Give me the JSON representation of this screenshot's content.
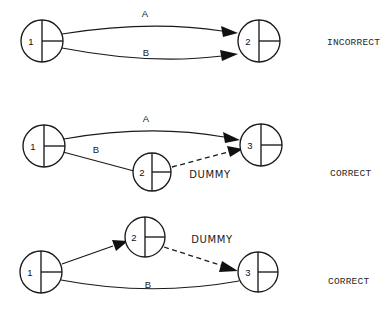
{
  "page": {
    "background_color": "#ffffff",
    "line_color": "#1a1a1a",
    "text_color": "#1a1a1a"
  },
  "diagrams": [
    {
      "id": "diagram-incorrect",
      "verdict": "INCORRECT",
      "nodes": [
        {
          "id": "n1",
          "label": "1"
        },
        {
          "id": "n2",
          "label": "2"
        }
      ],
      "edges": [
        {
          "id": "e-a",
          "label": "A",
          "style": "solid",
          "from": "1",
          "to": "2"
        },
        {
          "id": "e-b",
          "label": "B",
          "style": "solid",
          "from": "1",
          "to": "2"
        }
      ]
    },
    {
      "id": "diagram-correct-1",
      "verdict": "CORRECT",
      "nodes": [
        {
          "id": "n1",
          "label": "1"
        },
        {
          "id": "n2",
          "label": "2"
        },
        {
          "id": "n3",
          "label": "3"
        }
      ],
      "edges": [
        {
          "id": "e-a",
          "label": "A",
          "style": "solid",
          "from": "1",
          "to": "3"
        },
        {
          "id": "e-b",
          "label": "B",
          "style": "solid",
          "from": "1",
          "to": "2"
        },
        {
          "id": "e-dummy",
          "label": "DUMMY",
          "style": "dashed",
          "from": "2",
          "to": "3"
        }
      ]
    },
    {
      "id": "diagram-correct-2",
      "verdict": "CORRECT",
      "nodes": [
        {
          "id": "n1",
          "label": "1"
        },
        {
          "id": "n2",
          "label": "2"
        },
        {
          "id": "n3",
          "label": "3"
        }
      ],
      "edges": [
        {
          "id": "e-a",
          "label": "",
          "style": "solid",
          "from": "1",
          "to": "2"
        },
        {
          "id": "e-dummy",
          "label": "DUMMY",
          "style": "dashed",
          "from": "2",
          "to": "3"
        },
        {
          "id": "e-b",
          "label": "B",
          "style": "solid",
          "from": "1",
          "to": "3"
        }
      ]
    }
  ],
  "labels": {
    "a": "A",
    "b": "B",
    "dummy": "DUMMY",
    "incorrect": "INCORRECT",
    "correct": "CORRECT",
    "node_1": "1",
    "node_2": "2",
    "node_3": "3"
  }
}
